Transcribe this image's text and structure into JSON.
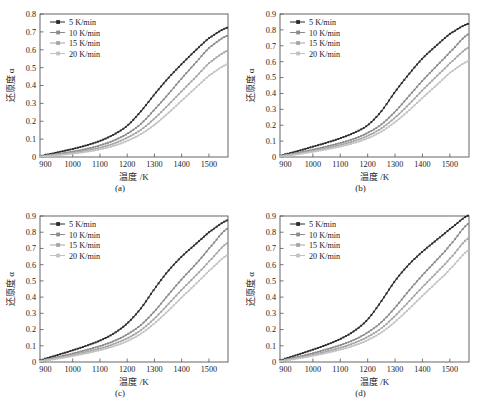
{
  "figure": {
    "panels": [
      {
        "id": "a",
        "caption": "(a)",
        "xlabel": "温度 /K",
        "ylabel": "还原度 α",
        "xticks": [
          "900",
          "1000",
          "1100",
          "1200",
          "1300",
          "1400",
          "1500"
        ],
        "yticks": [
          "0",
          "0.1",
          "0.2",
          "0.3",
          "0.4",
          "0.5",
          "0.6",
          "0.7",
          "0.8"
        ]
      },
      {
        "id": "b",
        "caption": "(b)",
        "xlabel": "温度 /K",
        "ylabel": "还原度 α",
        "xticks": [
          "900",
          "1000",
          "1100",
          "1200",
          "1300",
          "1400",
          "1500"
        ],
        "yticks": [
          "0",
          "0.1",
          "0.2",
          "0.3",
          "0.4",
          "0.5",
          "0.6",
          "0.7",
          "0.8",
          "0.9"
        ]
      },
      {
        "id": "c",
        "caption": "(c)",
        "xlabel": "温度 /K",
        "ylabel": "还原度 α",
        "xticks": [
          "900",
          "1000",
          "1100",
          "1200",
          "1300",
          "1400",
          "1500"
        ],
        "yticks": [
          "0",
          "0.1",
          "0.2",
          "0.3",
          "0.4",
          "0.5",
          "0.6",
          "0.7",
          "0.8",
          "0.9"
        ]
      },
      {
        "id": "d",
        "caption": "(d)",
        "xlabel": "温度 /K",
        "ylabel": "还原度 α",
        "xticks": [
          "900",
          "1000",
          "1100",
          "1200",
          "1300",
          "1400",
          "1500"
        ],
        "yticks": [
          "0",
          "0.1",
          "0.2",
          "0.3",
          "0.4",
          "0.5",
          "0.6",
          "0.7",
          "0.8",
          "0.9"
        ]
      }
    ],
    "legend": {
      "entries": [
        {
          "label": "5 K/min",
          "color": "#2b2b2b"
        },
        {
          "label": "10 K/min",
          "color": "#8a8a8a"
        },
        {
          "label": "15 K/min",
          "color": "#a5a5a5"
        },
        {
          "label": "20 K/min",
          "color": "#c2c2c2"
        }
      ]
    }
  },
  "chart_data": [
    {
      "type": "line",
      "panel": "a",
      "title": "",
      "caption": "(a)",
      "xlabel": "温度 /K",
      "ylabel": "还原度 α",
      "xlim": [
        880,
        1570
      ],
      "ylim": [
        0,
        0.8
      ],
      "xticks": [
        900,
        1000,
        1100,
        1200,
        1300,
        1400,
        1500
      ],
      "yticks": [
        0,
        0.1,
        0.2,
        0.3,
        0.4,
        0.5,
        0.6,
        0.7,
        0.8
      ],
      "grid": false,
      "legend_position": "upper-left",
      "x": [
        880,
        900,
        950,
        1000,
        1050,
        1100,
        1150,
        1200,
        1250,
        1300,
        1350,
        1400,
        1450,
        1500,
        1570
      ],
      "series": [
        {
          "name": "5 K/min",
          "color": "#2b2b2b",
          "values": [
            0.005,
            0.012,
            0.028,
            0.045,
            0.065,
            0.09,
            0.125,
            0.175,
            0.255,
            0.35,
            0.44,
            0.52,
            0.595,
            0.665,
            0.725
          ]
        },
        {
          "name": "10 K/min",
          "color": "#8a8a8a",
          "values": [
            0.003,
            0.008,
            0.018,
            0.03,
            0.045,
            0.065,
            0.092,
            0.13,
            0.185,
            0.265,
            0.35,
            0.44,
            0.525,
            0.61,
            0.68
          ]
        },
        {
          "name": "15 K/min",
          "color": "#a5a5a5",
          "values": [
            0.002,
            0.006,
            0.014,
            0.024,
            0.036,
            0.052,
            0.075,
            0.108,
            0.152,
            0.215,
            0.29,
            0.368,
            0.445,
            0.525,
            0.595
          ]
        },
        {
          "name": "20 K/min",
          "color": "#c2c2c2",
          "values": [
            0.002,
            0.005,
            0.011,
            0.019,
            0.029,
            0.043,
            0.062,
            0.09,
            0.128,
            0.18,
            0.245,
            0.315,
            0.385,
            0.455,
            0.52
          ]
        }
      ]
    },
    {
      "type": "line",
      "panel": "b",
      "title": "",
      "caption": "(b)",
      "xlabel": "温度 /K",
      "ylabel": "还原度 α",
      "xlim": [
        880,
        1570
      ],
      "ylim": [
        0,
        0.9
      ],
      "xticks": [
        900,
        1000,
        1100,
        1200,
        1300,
        1400,
        1500
      ],
      "yticks": [
        0,
        0.1,
        0.2,
        0.3,
        0.4,
        0.5,
        0.6,
        0.7,
        0.8,
        0.9
      ],
      "grid": false,
      "legend_position": "upper-left",
      "x": [
        880,
        900,
        950,
        1000,
        1050,
        1100,
        1150,
        1200,
        1250,
        1300,
        1350,
        1400,
        1450,
        1500,
        1570
      ],
      "series": [
        {
          "name": "5 K/min",
          "color": "#2b2b2b",
          "values": [
            0.008,
            0.018,
            0.04,
            0.065,
            0.09,
            0.118,
            0.152,
            0.2,
            0.288,
            0.41,
            0.52,
            0.62,
            0.7,
            0.775,
            0.84
          ]
        },
        {
          "name": "10 K/min",
          "color": "#8a8a8a",
          "values": [
            0.005,
            0.012,
            0.028,
            0.046,
            0.066,
            0.088,
            0.115,
            0.152,
            0.205,
            0.285,
            0.382,
            0.48,
            0.57,
            0.66,
            0.775
          ]
        },
        {
          "name": "15 K/min",
          "color": "#a5a5a5",
          "values": [
            0.004,
            0.01,
            0.023,
            0.039,
            0.056,
            0.076,
            0.1,
            0.133,
            0.18,
            0.248,
            0.33,
            0.42,
            0.505,
            0.59,
            0.69
          ]
        },
        {
          "name": "20 K/min",
          "color": "#c2c2c2",
          "values": [
            0.003,
            0.008,
            0.019,
            0.033,
            0.048,
            0.066,
            0.088,
            0.118,
            0.16,
            0.22,
            0.292,
            0.372,
            0.45,
            0.53,
            0.605
          ]
        }
      ]
    },
    {
      "type": "line",
      "panel": "c",
      "title": "",
      "caption": "(c)",
      "xlabel": "温度 /K",
      "ylabel": "还原度 α",
      "xlim": [
        880,
        1570
      ],
      "ylim": [
        0,
        0.9
      ],
      "xticks": [
        900,
        1000,
        1100,
        1200,
        1300,
        1400,
        1500
      ],
      "yticks": [
        0,
        0.1,
        0.2,
        0.3,
        0.4,
        0.5,
        0.6,
        0.7,
        0.8,
        0.9
      ],
      "grid": false,
      "legend_position": "upper-left",
      "x": [
        880,
        900,
        950,
        1000,
        1050,
        1100,
        1150,
        1200,
        1250,
        1300,
        1350,
        1400,
        1450,
        1500,
        1570
      ],
      "series": [
        {
          "name": "5 K/min",
          "color": "#2b2b2b",
          "values": [
            0.01,
            0.022,
            0.046,
            0.072,
            0.1,
            0.132,
            0.175,
            0.238,
            0.33,
            0.45,
            0.56,
            0.65,
            0.725,
            0.8,
            0.875
          ]
        },
        {
          "name": "10 K/min",
          "color": "#8a8a8a",
          "values": [
            0.006,
            0.015,
            0.032,
            0.052,
            0.074,
            0.098,
            0.128,
            0.17,
            0.228,
            0.312,
            0.412,
            0.51,
            0.6,
            0.7,
            0.825
          ]
        },
        {
          "name": "15 K/min",
          "color": "#a5a5a5",
          "values": [
            0.005,
            0.012,
            0.026,
            0.043,
            0.062,
            0.083,
            0.11,
            0.146,
            0.196,
            0.268,
            0.355,
            0.445,
            0.53,
            0.62,
            0.735
          ]
        },
        {
          "name": "20 K/min",
          "color": "#c2c2c2",
          "values": [
            0.004,
            0.01,
            0.022,
            0.037,
            0.054,
            0.073,
            0.097,
            0.129,
            0.174,
            0.238,
            0.315,
            0.398,
            0.478,
            0.562,
            0.66
          ]
        }
      ]
    },
    {
      "type": "line",
      "panel": "d",
      "title": "",
      "caption": "(d)",
      "xlabel": "温度 /K",
      "ylabel": "还原度 α",
      "xlim": [
        880,
        1570
      ],
      "ylim": [
        0,
        0.9
      ],
      "xticks": [
        900,
        1000,
        1100,
        1200,
        1300,
        1400,
        1500
      ],
      "yticks": [
        0,
        0.1,
        0.2,
        0.3,
        0.4,
        0.5,
        0.6,
        0.7,
        0.8,
        0.9
      ],
      "grid": false,
      "legend_position": "upper-left",
      "x": [
        880,
        900,
        950,
        1000,
        1050,
        1100,
        1150,
        1200,
        1250,
        1300,
        1350,
        1400,
        1450,
        1500,
        1570
      ],
      "series": [
        {
          "name": "5 K/min",
          "color": "#2b2b2b",
          "values": [
            0.01,
            0.022,
            0.048,
            0.076,
            0.106,
            0.142,
            0.19,
            0.262,
            0.375,
            0.5,
            0.6,
            0.68,
            0.75,
            0.82,
            0.905
          ]
        },
        {
          "name": "10 K/min",
          "color": "#8a8a8a",
          "values": [
            0.006,
            0.015,
            0.033,
            0.054,
            0.078,
            0.104,
            0.136,
            0.182,
            0.245,
            0.335,
            0.438,
            0.535,
            0.625,
            0.72,
            0.855
          ]
        },
        {
          "name": "15 K/min",
          "color": "#a5a5a5",
          "values": [
            0.005,
            0.012,
            0.027,
            0.045,
            0.065,
            0.088,
            0.116,
            0.155,
            0.208,
            0.284,
            0.372,
            0.462,
            0.548,
            0.638,
            0.765
          ]
        },
        {
          "name": "20 K/min",
          "color": "#c2c2c2",
          "values": [
            0.004,
            0.01,
            0.023,
            0.038,
            0.056,
            0.076,
            0.101,
            0.135,
            0.182,
            0.248,
            0.326,
            0.408,
            0.488,
            0.572,
            0.69
          ]
        }
      ]
    }
  ]
}
